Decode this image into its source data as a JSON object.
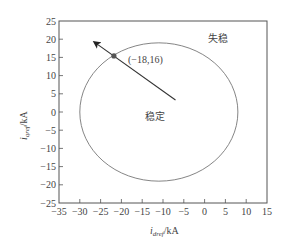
{
  "chart_data": {
    "type": "scatter",
    "title": "",
    "xlabel": "i_dref/kA",
    "ylabel": "i_qref/kA",
    "xlabel_parts": {
      "var": "i",
      "sub": "dref",
      "unit": "/kA"
    },
    "ylabel_parts": {
      "var": "i",
      "sub": "qref",
      "unit": "/kA"
    },
    "xlim": [
      -35,
      15
    ],
    "ylim": [
      -25,
      25
    ],
    "xticks": [
      -35,
      -30,
      -25,
      -20,
      -15,
      -10,
      -5,
      0,
      5,
      10,
      15
    ],
    "yticks": [
      -25,
      -20,
      -15,
      -10,
      -5,
      0,
      5,
      10,
      15,
      20,
      25
    ],
    "xtick_labels": [
      "−35",
      "−30",
      "−25",
      "−20",
      "−15",
      "−10",
      "−5",
      "0",
      "5",
      "10",
      "15"
    ],
    "ytick_labels": [
      "−25",
      "−20",
      "−15",
      "−10",
      "−5",
      "0",
      "5",
      "10",
      "15",
      "20",
      "25"
    ],
    "grid": false,
    "legend": null,
    "series": [
      {
        "name": "stability boundary circle",
        "shape": "circle",
        "center": [
          -11,
          0
        ],
        "radius": 19
      },
      {
        "name": "operating trajectory arrow",
        "shape": "arrow",
        "from": [
          -7,
          3.3
        ],
        "to": [
          -26.5,
          19.2
        ]
      },
      {
        "name": "boundary intersection point",
        "shape": "point",
        "x": -21.8,
        "y": 15.4,
        "label": "(−18,16)"
      }
    ],
    "annotations": [
      {
        "text": "失稳",
        "meaning": "unstable",
        "x": 2,
        "y": 20
      },
      {
        "text": "稳定",
        "meaning": "stable",
        "x": -12,
        "y": 1.5
      },
      {
        "text": "(−18,16)",
        "x": -18.5,
        "y": 14.5
      }
    ]
  },
  "labels": {
    "unstable": "失稳",
    "stable": "稳定",
    "point": "(−18,16)",
    "x_var": "i",
    "x_sub": "dref",
    "x_unit": "/kA",
    "y_var": "i",
    "y_sub": "qref",
    "y_unit": "/kA"
  }
}
